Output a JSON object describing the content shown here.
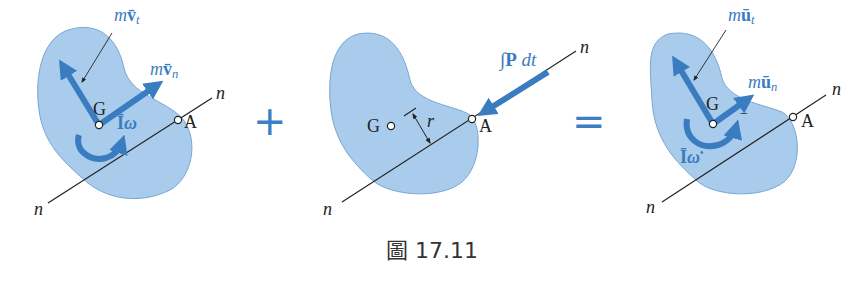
{
  "colors": {
    "body_fill": "#a9cbec",
    "body_stroke": "#6f9cc9",
    "vector_blue": "#3a7cc0",
    "line_black": "#222222",
    "label_blue": "#3a7cc0",
    "operator_blue": "#3d7fc6"
  },
  "panels": [
    {
      "id": "initial-momenta",
      "labels": {
        "vt_m": "m",
        "vt_v": "v̄",
        "vt_sub": "t",
        "vn_m": "m",
        "vn_v": "v̄",
        "vn_sub": "n",
        "G": "G",
        "A": "A",
        "n_top": "n",
        "n_bottom": "n",
        "Iw_I": "Ī",
        "Iw_w": "ω"
      }
    },
    {
      "id": "impulse",
      "labels": {
        "impulse": "∫P dt",
        "impulse_int": "∫",
        "impulse_P": "P",
        "impulse_dt": "dt",
        "G": "G",
        "A": "A",
        "r": "r",
        "n_top": "n",
        "n_bottom": "n"
      }
    },
    {
      "id": "final-momenta",
      "labels": {
        "ut_m": "m",
        "ut_u": "ū",
        "ut_sub": "t",
        "un_m": "m",
        "un_u": "ū",
        "un_sub": "n",
        "G": "G",
        "A": "A",
        "n_top": "n",
        "n_bottom": "n",
        "Iw_I": "Ī",
        "Iw_w": "ω",
        "Iw_sup": "•",
        "dash": "−"
      }
    }
  ],
  "operators": {
    "plus": "+",
    "equals": "="
  },
  "caption": "圖 17.11"
}
